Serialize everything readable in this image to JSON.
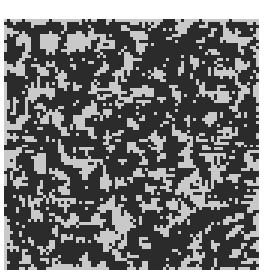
{
  "image": {
    "description": "Binary random noise texture",
    "background_color": "#ffffff",
    "dark_color": "#2b2b2b",
    "light_color": "#c9c9c9",
    "grid": {
      "cols": 85,
      "rows": 84
    },
    "dark_fraction": 0.55,
    "seed": 12345
  }
}
